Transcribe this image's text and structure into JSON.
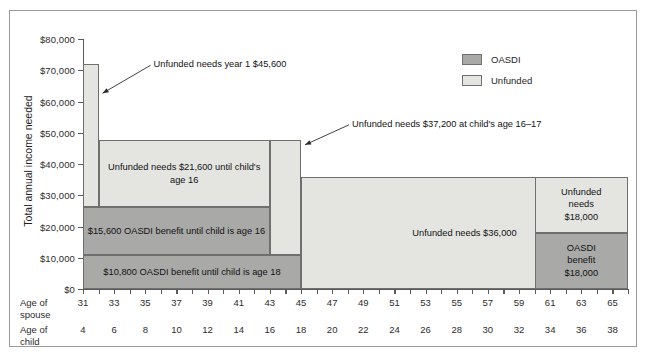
{
  "chart_data": {
    "type": "area",
    "title": "",
    "xlabel": "Age of spouse / Age of child",
    "ylabel": "Total annual income needed",
    "ylim": [
      0,
      80000
    ],
    "ytick_values": [
      0,
      10000,
      20000,
      30000,
      40000,
      50000,
      60000,
      70000,
      80000
    ],
    "ytick_labels": [
      "$0",
      "$10,000",
      "$20,000",
      "$30,000",
      "$40,000",
      "$50,000",
      "$60,000",
      "$70,000",
      "$80,000"
    ],
    "xlim": [
      31,
      66
    ],
    "xtick_spouse_ages": [
      31,
      32,
      33,
      34,
      35,
      36,
      37,
      38,
      39,
      40,
      41,
      42,
      43,
      44,
      45,
      46,
      47,
      48,
      49,
      50,
      51,
      52,
      53,
      54,
      55,
      56,
      57,
      58,
      59,
      60,
      61,
      62,
      63,
      64,
      65,
      66
    ],
    "xlabels_spouse": [
      "31",
      "33",
      "35",
      "37",
      "39",
      "41",
      "43",
      "45",
      "47",
      "49",
      "51",
      "53",
      "55",
      "57",
      "59",
      "61",
      "63",
      "65"
    ],
    "xlabels_child": [
      "4",
      "6",
      "8",
      "10",
      "12",
      "14",
      "16",
      "18",
      "20",
      "22",
      "24",
      "26",
      "28",
      "30",
      "32",
      "34",
      "36",
      "38"
    ],
    "grid": false,
    "legend_position": "top-right",
    "legend": [
      "OASDI",
      "Unfunded"
    ],
    "series": [
      {
        "name": "OASDI",
        "color": "#a9a9a7",
        "segments": [
          {
            "x_start": 31,
            "x_end": 32,
            "y_start": 0,
            "y_end": 26400,
            "label": ""
          },
          {
            "x_start": 31,
            "x_end": 43,
            "y_start": 10800,
            "y_end": 26400,
            "label": "$15,600 OASDI benefit until child is age 16"
          },
          {
            "x_start": 31,
            "x_end": 45,
            "y_start": 0,
            "y_end": 10800,
            "label": "$10,800 OASDI benefit until child is age 18"
          },
          {
            "x_start": 60,
            "x_end": 66,
            "y_start": 0,
            "y_end": 18000,
            "label": "OASDI benefit\n$18,000"
          }
        ]
      },
      {
        "name": "Unfunded",
        "color": "#e4e4e1",
        "segments": [
          {
            "x_start": 31,
            "x_end": 32,
            "y_start": 26400,
            "y_end": 72000,
            "label": ""
          },
          {
            "x_start": 32,
            "x_end": 43,
            "y_start": 26400,
            "y_end": 47600,
            "label": "Unfunded needs $21,600 until child's\nage 16"
          },
          {
            "x_start": 43,
            "x_end": 45,
            "y_start": 10800,
            "y_end": 47600,
            "label": ""
          },
          {
            "x_start": 45,
            "x_end": 66,
            "y_start": 0,
            "y_end": 36000,
            "label": "Unfunded needs $36,000"
          },
          {
            "x_start": 60,
            "x_end": 66,
            "y_start": 18000,
            "y_end": 36000,
            "label": "Unfunded needs\n$18,000"
          }
        ]
      }
    ],
    "annotations": [
      {
        "text": "Unfunded needs year 1 $45,600",
        "target_x": 32,
        "target_y": 62000
      },
      {
        "text": "Unfunded needs $37,200 at child's age 16–17",
        "target_x": 45,
        "target_y": 45500
      }
    ]
  },
  "axis_row_labels": {
    "spouse": "Age of\nspouse",
    "child": "Age of\nchild"
  }
}
